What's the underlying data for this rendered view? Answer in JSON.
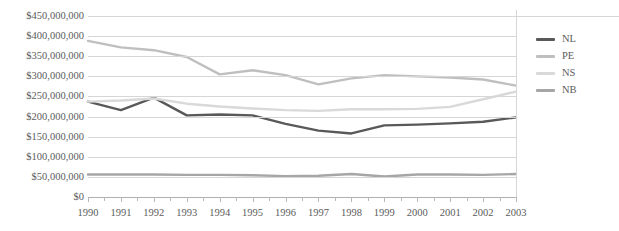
{
  "chart_data": {
    "type": "line",
    "title": "",
    "xlabel": "",
    "ylabel": "",
    "x": [
      1990,
      1991,
      1992,
      1993,
      1994,
      1995,
      1996,
      1997,
      1998,
      1999,
      2000,
      2001,
      2002,
      2003
    ],
    "categories": [
      "1990",
      "1991",
      "1992",
      "1993",
      "1994",
      "1995",
      "1996",
      "1997",
      "1998",
      "1999",
      "2000",
      "2001",
      "2002",
      "2003"
    ],
    "ylim": [
      0,
      450000000
    ],
    "ytick_step": 50000000,
    "ytick_labels": [
      "$450,000,000",
      "$400,000,000",
      "$350,000,000",
      "$300,000,000",
      "$250,000,000",
      "$200,000,000",
      "$150,000,000",
      "$100,000,000",
      "$50,000,000",
      "$0"
    ],
    "ytick_values": [
      450000000,
      400000000,
      350000000,
      300000000,
      250000000,
      200000000,
      150000000,
      100000000,
      50000000,
      0
    ],
    "grid": true,
    "legend_position": "right",
    "series": [
      {
        "name": "NL",
        "color": "#595959",
        "values": [
          237000000,
          216000000,
          247000000,
          203000000,
          205000000,
          203000000,
          182000000,
          165000000,
          158000000,
          178000000,
          180000000,
          183000000,
          187000000,
          198000000
        ]
      },
      {
        "name": "PE",
        "color": "#bfbfbf",
        "values": [
          388000000,
          372000000,
          365000000,
          348000000,
          305000000,
          315000000,
          303000000,
          280000000,
          295000000,
          303000000,
          300000000,
          297000000,
          292000000,
          277000000
        ]
      },
      {
        "name": "NS",
        "color": "#d9d9d9",
        "values": [
          237000000,
          240000000,
          245000000,
          232000000,
          225000000,
          220000000,
          216000000,
          214000000,
          218000000,
          218000000,
          219000000,
          224000000,
          243000000,
          262000000
        ]
      },
      {
        "name": "NB",
        "color": "#a6a6a6",
        "values": [
          56000000,
          56000000,
          56000000,
          55000000,
          55000000,
          54000000,
          52000000,
          53000000,
          57000000,
          51000000,
          56000000,
          56000000,
          55000000,
          57000000
        ]
      }
    ]
  },
  "legend": {
    "items": [
      {
        "label": "NL"
      },
      {
        "label": "PE"
      },
      {
        "label": "NS"
      },
      {
        "label": "NB"
      }
    ]
  },
  "colors": {
    "gridline": "#d6d6d6",
    "axis_text": "#5b5b5b",
    "background": "#ffffff"
  }
}
